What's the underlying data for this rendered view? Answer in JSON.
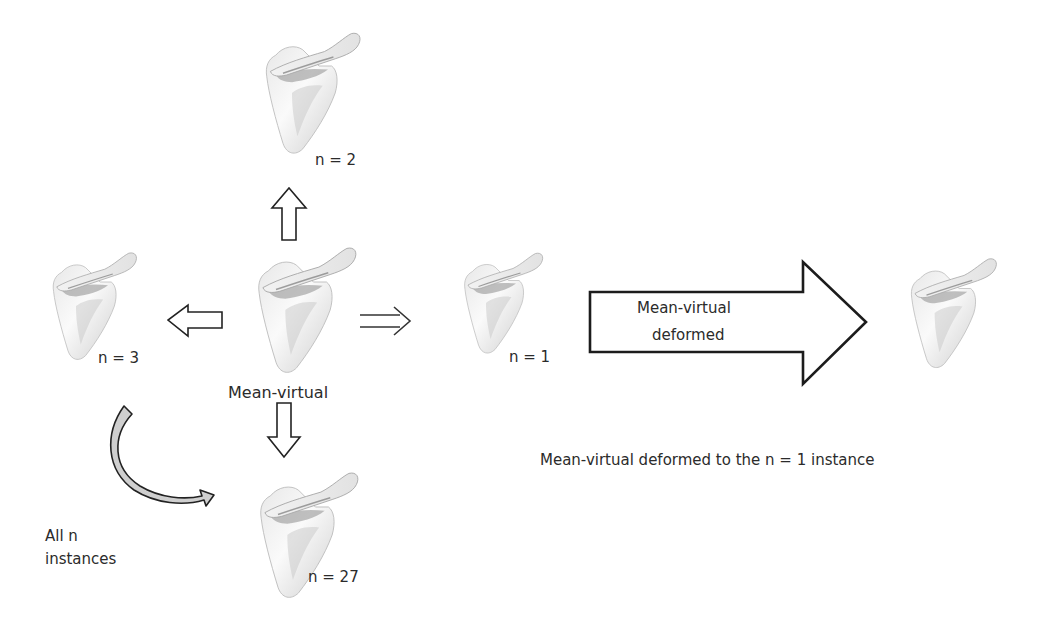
{
  "diagram": {
    "type": "flow",
    "nodes": [
      {
        "id": "mean",
        "label": "Mean-virtual",
        "kind": "scapula-model",
        "role": "center"
      },
      {
        "id": "n2",
        "label": "n = 2",
        "kind": "scapula-instance",
        "position": "top"
      },
      {
        "id": "n3",
        "label": "n = 3",
        "kind": "scapula-instance",
        "position": "left"
      },
      {
        "id": "n27",
        "label": "n = 27",
        "kind": "scapula-instance",
        "position": "bottom"
      },
      {
        "id": "n1",
        "label": "n = 1",
        "kind": "scapula-instance",
        "position": "right"
      },
      {
        "id": "deformed",
        "label": "",
        "kind": "scapula-deformed",
        "position": "far-right"
      }
    ],
    "edges": [
      {
        "from": "mean",
        "to": "n2",
        "style": "hollow-arrow-up"
      },
      {
        "from": "mean",
        "to": "n3",
        "style": "hollow-arrow-left"
      },
      {
        "from": "mean",
        "to": "n27",
        "style": "hollow-arrow-down"
      },
      {
        "from": "mean",
        "to": "n1",
        "style": "double-line-arrow-right"
      },
      {
        "from": "n1",
        "to": "deformed",
        "style": "large-hollow-arrow-right",
        "label": "Mean-virtual deformed"
      },
      {
        "from": "n3",
        "to": "n27",
        "style": "curved-arrow",
        "label": "All n instances"
      }
    ]
  },
  "labels": {
    "mean_virtual": "Mean-virtual",
    "n2": "n = 2",
    "n3": "n = 3",
    "n27": "n = 27",
    "n1": "n = 1",
    "big_arrow_line1": "Mean-virtual",
    "big_arrow_line2": "deformed",
    "all_n_line1": "All n",
    "all_n_line2": "instances",
    "caption": "Mean-virtual deformed to the n = 1 instance"
  },
  "colors": {
    "background": "#ffffff",
    "outline": "#222222",
    "bone_light": "#f4f4f4",
    "bone_shadow": "#9a9a9a",
    "curved_arrow_fill": "#cfcfcf"
  }
}
